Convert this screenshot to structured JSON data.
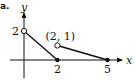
{
  "chart_data": {
    "type": "line",
    "title": "",
    "part_label": "a.",
    "xlabel": "x",
    "ylabel": "y",
    "xlim": [
      -0.6,
      6.2
    ],
    "ylim": [
      -0.6,
      2.8
    ],
    "grid": false,
    "x_tick_labels": [
      {
        "value": 2,
        "label": "2"
      },
      {
        "value": 5,
        "label": "5"
      }
    ],
    "y_tick_labels": [
      {
        "value": 2,
        "label": "2"
      }
    ],
    "segments": [
      {
        "name": "segment-1",
        "from": [
          0,
          2
        ],
        "to": [
          2,
          0
        ]
      },
      {
        "name": "segment-2",
        "from": [
          2,
          1
        ],
        "to": [
          5,
          0
        ]
      }
    ],
    "points": [
      {
        "name": "point-0-2",
        "x": 0,
        "y": 2,
        "style": "open"
      },
      {
        "name": "point-2-0",
        "x": 2,
        "y": 0,
        "style": "closed"
      },
      {
        "name": "point-2-1",
        "x": 2,
        "y": 1,
        "style": "open"
      },
      {
        "name": "point-5-0",
        "x": 5,
        "y": 0,
        "style": "closed"
      }
    ],
    "annotations": [
      {
        "text": "(2, 1)",
        "at": [
          2,
          1
        ]
      }
    ]
  }
}
